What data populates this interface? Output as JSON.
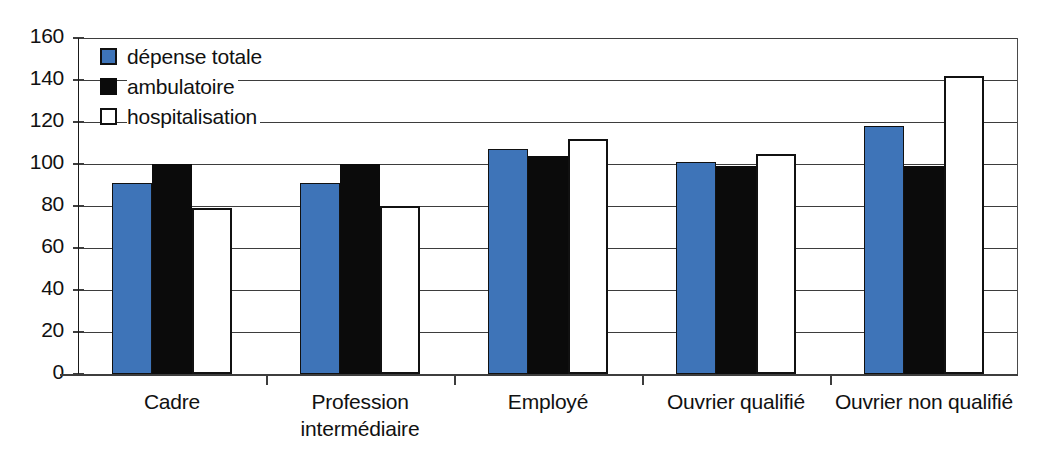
{
  "chart_data": {
    "type": "bar",
    "title": "",
    "subtitle": "",
    "xlabel": "",
    "ylabel": "",
    "ylim": [
      0,
      160
    ],
    "yticks": [
      0,
      20,
      40,
      60,
      80,
      100,
      120,
      140,
      160
    ],
    "grid": true,
    "legend_position": "inside-top-left",
    "categories": [
      "Cadre",
      "Profession intermédiaire",
      "Employé",
      "Ouvrier qualifié",
      "Ouvrier non qualifié"
    ],
    "category_lines": [
      [
        "Cadre"
      ],
      [
        "Profession",
        "intermédiaire"
      ],
      [
        "Employé"
      ],
      [
        "Ouvrier qualifié"
      ],
      [
        "Ouvrier non qualifié"
      ]
    ],
    "series": [
      {
        "name": "dépense totale",
        "color": "#3e74b8",
        "values": [
          91,
          91,
          107,
          101,
          118
        ]
      },
      {
        "name": "ambulatoire",
        "color": "#0b0b0b",
        "values": [
          100,
          100,
          104,
          99,
          99
        ]
      },
      {
        "name": "hospitalisation",
        "color": "#ffffff",
        "values": [
          79,
          80,
          112,
          105,
          142
        ]
      }
    ]
  },
  "legend": {
    "items": [
      {
        "label": "dépense totale",
        "swatch": "blue-square-swatch"
      },
      {
        "label": "ambulatoire",
        "swatch": "black-square-swatch"
      },
      {
        "label": "hospitalisation",
        "swatch": "white-square-swatch"
      }
    ]
  },
  "axes": {
    "y_tick_labels": [
      "160",
      "140",
      "120",
      "100",
      "80",
      "60",
      "40",
      "20",
      "0"
    ]
  },
  "colors": {
    "series_total": "#3e74b8",
    "series_ambulatoire": "#0b0b0b",
    "series_hospitalisation": "#ffffff",
    "axis": "#3d3d3d",
    "text": "#111111",
    "background": "#ffffff"
  }
}
